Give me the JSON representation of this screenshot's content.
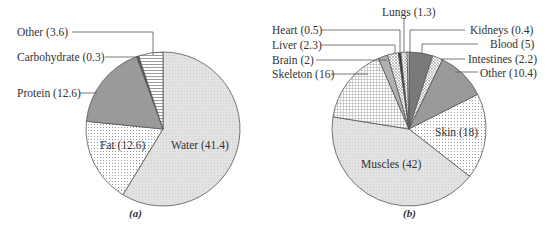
{
  "chart_data": [
    {
      "type": "pie",
      "caption": "(a)",
      "total": 70.5,
      "start_angle": "12 o'clock, clockwise",
      "slices": [
        {
          "label": "Water",
          "value": 41.4,
          "text": "Water (41.4)",
          "fill": "#e4e4e4",
          "pattern": "dots-light",
          "label_pos": "inside"
        },
        {
          "label": "Fat",
          "value": 12.6,
          "text": "Fat (12.6)",
          "fill": "#ffffff",
          "pattern": "dots",
          "label_pos": "inside"
        },
        {
          "label": "Protein",
          "value": 12.6,
          "text": "Protein (12.6)",
          "fill": "#9a9a9a",
          "pattern": "solid",
          "label_pos": "outside"
        },
        {
          "label": "Carbohydrate",
          "value": 0.3,
          "text": "Carbohydrate (0.3)",
          "fill": "#555555",
          "pattern": "solid",
          "label_pos": "outside"
        },
        {
          "label": "Other",
          "value": 3.6,
          "text": "Other (3.6)",
          "fill": "#ffffff",
          "pattern": "hlines",
          "label_pos": "outside"
        }
      ]
    },
    {
      "type": "pie",
      "caption": "(b)",
      "total": 100.1,
      "start_angle": "12 o'clock, clockwise",
      "slices": [
        {
          "label": "Blood",
          "value": 5,
          "text": "Blood (5)",
          "fill": "#7a7a7a",
          "pattern": "solid",
          "label_pos": "outside-right"
        },
        {
          "label": "Intestines",
          "value": 2.2,
          "text": "Intestines (2.2)",
          "fill": "#ffffff",
          "pattern": "crosshatch",
          "label_pos": "outside-right"
        },
        {
          "label": "Other",
          "value": 10.4,
          "text": "Other (10.4)",
          "fill": "#9a9a9a",
          "pattern": "solid",
          "label_pos": "outside-right"
        },
        {
          "label": "Skin",
          "value": 18,
          "text": "Skin (18)",
          "fill": "#ffffff",
          "pattern": "dots",
          "label_pos": "inside"
        },
        {
          "label": "Muscles",
          "value": 42,
          "text": "Muscles (42)",
          "fill": "#e4e4e4",
          "pattern": "dots-light",
          "label_pos": "inside"
        },
        {
          "label": "Skeleton",
          "value": 16,
          "text": "Skeleton (16)",
          "fill": "#ffffff",
          "pattern": "grid",
          "label_pos": "outside-left"
        },
        {
          "label": "Brain",
          "value": 2,
          "text": "Brain (2)",
          "fill": "#b0b0b0",
          "pattern": "solid",
          "label_pos": "outside-left"
        },
        {
          "label": "Liver",
          "value": 2.3,
          "text": "Liver (2.3)",
          "fill": "#ffffff",
          "pattern": "crosshatch",
          "label_pos": "outside-left"
        },
        {
          "label": "Heart",
          "value": 0.5,
          "text": "Heart (0.5)",
          "fill": "#333333",
          "pattern": "solid",
          "label_pos": "outside-left"
        },
        {
          "label": "Lungs",
          "value": 1.3,
          "text": "Lungs (1.3)",
          "fill": "#ffffff",
          "pattern": "crosshatch",
          "label_pos": "outside-top"
        },
        {
          "label": "Kidneys",
          "value": 0.4,
          "text": "Kidneys (0.4)",
          "fill": "#eeeeee",
          "pattern": "solid",
          "label_pos": "outside-right"
        }
      ]
    }
  ],
  "labels": {
    "a": {
      "water": "Water (41.4)",
      "fat": "Fat (12.6)",
      "protein": "Protein (12.6)",
      "carbohydrate": "Carbohydrate (0.3)",
      "other": "Other (3.6)",
      "caption": "(a)"
    },
    "b": {
      "lungs": "Lungs (1.3)",
      "heart": "Heart (0.5)",
      "liver": "Liver (2.3)",
      "brain": "Brain (2)",
      "skeleton": "Skeleton (16)",
      "kidneys": "Kidneys (0.4)",
      "blood": "Blood (5)",
      "intestines": "Intestines (2.2)",
      "other": "Other (10.4)",
      "skin": "Skin (18)",
      "muscles": "Muscles (42)",
      "caption": "(b)"
    }
  }
}
